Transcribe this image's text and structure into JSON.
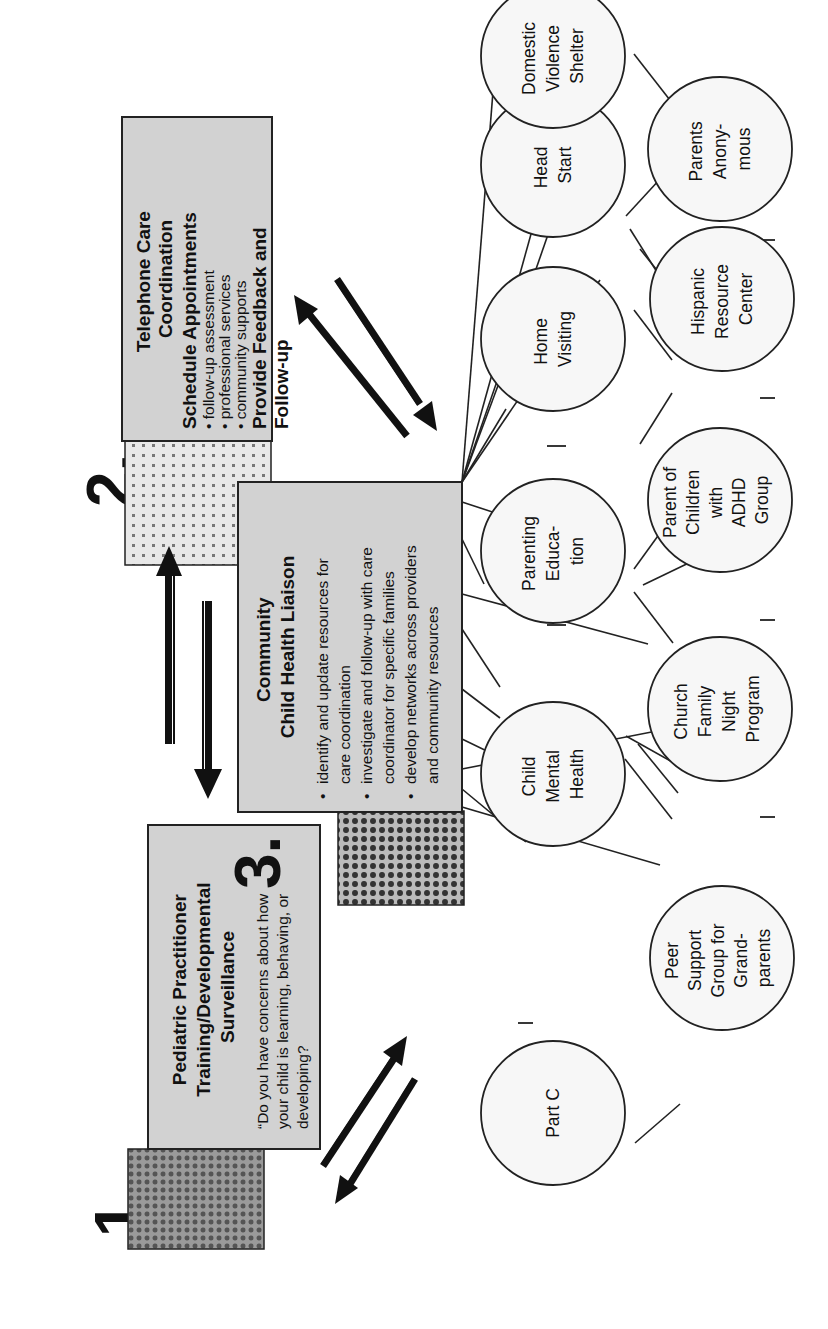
{
  "steps": [
    {
      "number": "1.",
      "title_lines": [
        "Pediatric Practitioner",
        "Training/Developmental",
        "Surveillance"
      ],
      "quote_lines": [
        "“Do you have concerns about how",
        "your child is learning, behaving, or",
        "developing?"
      ]
    },
    {
      "number": "2.",
      "title_lines": [
        "Telephone Care",
        "Coordination"
      ],
      "subtitle": "Schedule Appointments",
      "bullets": [
        "follow-up assessment",
        "professional services",
        "community supports"
      ],
      "footer_lines": [
        "Provide Feedback and",
        "Follow-up"
      ]
    },
    {
      "number": "3.",
      "title_lines": [
        "Community",
        "Child Health Liaison"
      ],
      "bullets": [
        [
          "identify and update resources for",
          "care coordination"
        ],
        [
          "investigate and follow-up with care",
          "coordinator for specific families"
        ],
        [
          "develop networks across providers",
          "and community resources"
        ]
      ]
    }
  ],
  "resources": [
    {
      "id": "part-c",
      "lines": [
        "Part C"
      ]
    },
    {
      "id": "child-mental-health",
      "lines": [
        "Child",
        "Mental",
        "Health"
      ]
    },
    {
      "id": "parenting-education",
      "lines": [
        "Parenting",
        "Educa-",
        "tion"
      ]
    },
    {
      "id": "home-visiting",
      "lines": [
        "Home",
        "Visiting"
      ]
    },
    {
      "id": "head-start",
      "lines": [
        "Head",
        "Start"
      ]
    },
    {
      "id": "domestic-violence-shelter",
      "lines": [
        "Domestic",
        "Violence",
        "Shelter"
      ]
    },
    {
      "id": "peer-support-grandparents",
      "lines": [
        "Peer",
        "Support",
        "Group for",
        "Grand-",
        "parents"
      ]
    },
    {
      "id": "church-family-night",
      "lines": [
        "Church",
        "Family",
        "Night",
        "Program"
      ]
    },
    {
      "id": "parent-adhd-group",
      "lines": [
        "Parent of",
        "Children",
        "with",
        "ADHD",
        "Group"
      ]
    },
    {
      "id": "hispanic-resource-center",
      "lines": [
        "Hispanic",
        "Resource",
        "Center"
      ]
    },
    {
      "id": "parents-anonymous",
      "lines": [
        "Parents",
        "Anony-",
        "mous"
      ]
    }
  ],
  "arrows": [
    {
      "from": "step-1",
      "to": "step-3",
      "direction": "bidirectional"
    },
    {
      "from": "step-1",
      "to": "step-2",
      "direction": "bidirectional"
    },
    {
      "from": "step-2",
      "to": "step-3",
      "direction": "bidirectional"
    }
  ]
}
